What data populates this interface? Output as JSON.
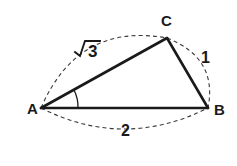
{
  "figure": {
    "type": "geometry-diagram",
    "shape": "triangle",
    "background_color": "#ffffff",
    "line_color": "#1a1a1a",
    "dash_color": "#3a3a3a",
    "width": 237,
    "height": 166
  },
  "vertices": {
    "a": {
      "label": "A",
      "x": 41,
      "y": 108,
      "label_x": 27,
      "label_y": 114
    },
    "b": {
      "label": "B",
      "x": 208,
      "y": 108,
      "label_x": 214,
      "label_y": 115
    },
    "c": {
      "label": "C",
      "x": 167,
      "y": 38,
      "label_x": 161,
      "label_y": 26
    }
  },
  "sides": [
    {
      "name": "side-ac",
      "from": "A",
      "to": "C",
      "label": "3",
      "label_display": "√3",
      "has_radical": true,
      "label_x": 92,
      "label_y": 58
    },
    {
      "name": "side-cb",
      "from": "C",
      "to": "B",
      "label": "1",
      "has_radical": false,
      "label_x": 205,
      "label_y": 62
    },
    {
      "name": "side-ab",
      "from": "A",
      "to": "B",
      "label": "2",
      "has_radical": false,
      "label_x": 126,
      "label_y": 135
    }
  ],
  "angle_marks": [
    {
      "name": "angle-at-a",
      "vertex": "A",
      "label": ""
    }
  ]
}
